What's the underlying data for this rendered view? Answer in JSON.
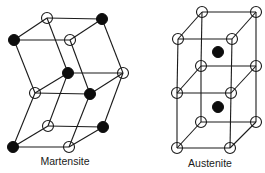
{
  "figure": {
    "structures": [
      {
        "id": "martensite",
        "label": "Martensite",
        "label_pos": [
          65,
          165
        ],
        "atom_radius": 5.5,
        "atoms": [
          {
            "x": 47,
            "y": 18,
            "type": "open"
          },
          {
            "x": 102,
            "y": 19,
            "type": "filled"
          },
          {
            "x": 14,
            "y": 40,
            "type": "filled"
          },
          {
            "x": 70,
            "y": 40,
            "type": "open"
          },
          {
            "x": 68,
            "y": 73,
            "type": "filled"
          },
          {
            "x": 123,
            "y": 73,
            "type": "open"
          },
          {
            "x": 35,
            "y": 93,
            "type": "open"
          },
          {
            "x": 90,
            "y": 94,
            "type": "filled"
          },
          {
            "x": 48,
            "y": 126,
            "type": "open"
          },
          {
            "x": 103,
            "y": 127,
            "type": "filled"
          },
          {
            "x": 13,
            "y": 147,
            "type": "filled"
          },
          {
            "x": 69,
            "y": 147,
            "type": "open"
          }
        ],
        "edges": [
          [
            0,
            1
          ],
          [
            2,
            3
          ],
          [
            2,
            0
          ],
          [
            3,
            1
          ],
          [
            0,
            4
          ],
          [
            1,
            5
          ],
          [
            2,
            6
          ],
          [
            3,
            7
          ],
          [
            4,
            5
          ],
          [
            6,
            7
          ],
          [
            6,
            4
          ],
          [
            7,
            5
          ],
          [
            4,
            8
          ],
          [
            5,
            9
          ],
          [
            6,
            10
          ],
          [
            7,
            11
          ],
          [
            8,
            9
          ],
          [
            10,
            11
          ],
          [
            10,
            8
          ],
          [
            11,
            9
          ]
        ]
      },
      {
        "id": "austenite",
        "label": "Austenite",
        "label_pos": [
          210,
          167
        ],
        "atom_radius": 5.5,
        "atoms": [
          {
            "x": 202,
            "y": 12,
            "type": "open"
          },
          {
            "x": 256,
            "y": 12,
            "type": "open"
          },
          {
            "x": 178,
            "y": 39,
            "type": "open"
          },
          {
            "x": 232,
            "y": 39,
            "type": "open"
          },
          {
            "x": 201,
            "y": 66,
            "type": "open"
          },
          {
            "x": 256,
            "y": 66,
            "type": "open"
          },
          {
            "x": 177,
            "y": 93,
            "type": "open"
          },
          {
            "x": 231,
            "y": 93,
            "type": "open"
          },
          {
            "x": 201,
            "y": 122,
            "type": "open"
          },
          {
            "x": 256,
            "y": 122,
            "type": "open"
          },
          {
            "x": 177,
            "y": 148,
            "type": "open"
          },
          {
            "x": 230,
            "y": 148,
            "type": "open"
          },
          {
            "x": 218,
            "y": 52,
            "type": "filled"
          },
          {
            "x": 218,
            "y": 107,
            "type": "filled"
          }
        ],
        "edges": [
          [
            0,
            1
          ],
          [
            2,
            3
          ],
          [
            0,
            2
          ],
          [
            1,
            3
          ],
          [
            4,
            5
          ],
          [
            6,
            7
          ],
          [
            4,
            6
          ],
          [
            5,
            7
          ],
          [
            8,
            9
          ],
          [
            10,
            11
          ],
          [
            8,
            10
          ],
          [
            9,
            11
          ],
          [
            0,
            4
          ],
          [
            4,
            8
          ],
          [
            1,
            5
          ],
          [
            5,
            9
          ],
          [
            2,
            6
          ],
          [
            6,
            10
          ],
          [
            3,
            7
          ],
          [
            7,
            11
          ]
        ]
      }
    ]
  }
}
